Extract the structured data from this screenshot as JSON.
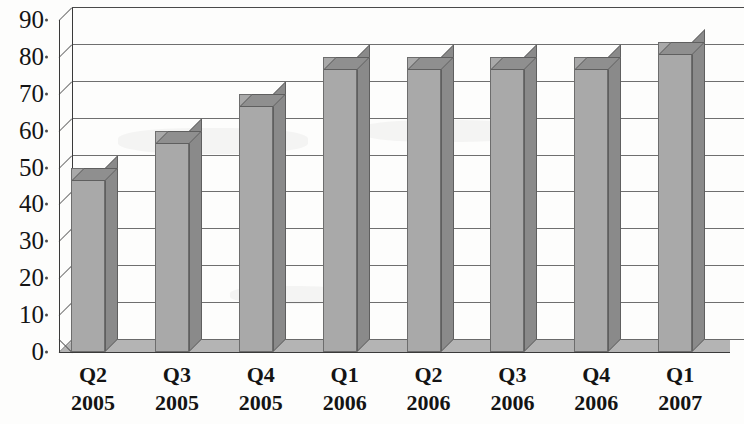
{
  "chart_data": {
    "type": "bar",
    "title": "",
    "subtitle": "",
    "xlabel": "",
    "ylabel": "",
    "categories": [
      "Q2 2005",
      "Q3 2005",
      "Q4 2005",
      "Q1 2006",
      "Q2 2006",
      "Q3 2006",
      "Q4 2006",
      "Q1 2007"
    ],
    "category_parts": [
      {
        "quarter": "Q2",
        "year": "2005"
      },
      {
        "quarter": "Q3",
        "year": "2005"
      },
      {
        "quarter": "Q4",
        "year": "2005"
      },
      {
        "quarter": "Q1",
        "year": "2006"
      },
      {
        "quarter": "Q2",
        "year": "2006"
      },
      {
        "quarter": "Q3",
        "year": "2006"
      },
      {
        "quarter": "Q4",
        "year": "2006"
      },
      {
        "quarter": "Q1",
        "year": "2007"
      }
    ],
    "values": [
      50,
      60,
      70,
      80,
      80,
      80,
      80,
      84
    ],
    "ylim": [
      0,
      90
    ],
    "ytick_labels": [
      "0",
      "10",
      "20",
      "30",
      "40",
      "50",
      "60",
      "70",
      "80",
      "90"
    ],
    "ytick_values": [
      0,
      10,
      20,
      30,
      40,
      50,
      60,
      70,
      80,
      90
    ],
    "grid": true,
    "legend": false,
    "legend_position": "none",
    "style": {
      "bar_face_color": "#a9a9a9",
      "bar_top_color": "#8f8f8f",
      "bar_side_color": "#8a8a8a",
      "bar_edge_color": "#6d6d6d",
      "gridline_color": "#6f6f6f",
      "axis_color": "#3a3a3a",
      "background_color": "#fdfdfc",
      "text_color": "#141414",
      "three_d": true
    }
  }
}
